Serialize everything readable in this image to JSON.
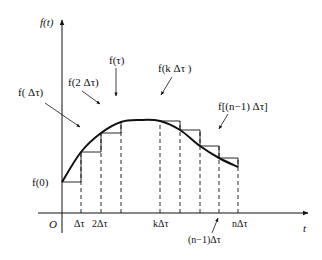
{
  "diagram": {
    "type": "staircase-approximation",
    "axes": {
      "y_label": "f(t)",
      "x_label": "t",
      "origin_label": "O"
    },
    "x_ticks": [
      {
        "label": "Δτ",
        "x": 81
      },
      {
        "label": "2Δτ",
        "x": 101
      },
      {
        "label": "kΔτ",
        "x": 160
      },
      {
        "label": "nΔτ",
        "x": 238
      }
    ],
    "x_tick_callout": {
      "label": "(n−1)Δτ",
      "x": 219
    },
    "annotations": [
      {
        "id": "f0",
        "label": "f(0)"
      },
      {
        "id": "f-dtau",
        "label": "f( Δτ)"
      },
      {
        "id": "f-2dtau",
        "label": "f(2 Δτ)"
      },
      {
        "id": "f-tau",
        "label": "f(τ)"
      },
      {
        "id": "f-kdtau",
        "label": "f(k Δτ )"
      },
      {
        "id": "f-n1dtau",
        "label": "f[(n−1) Δτ]"
      }
    ],
    "curve_points": [
      [
        62,
        182
      ],
      [
        81,
        152
      ],
      [
        101,
        133
      ],
      [
        121,
        122
      ],
      [
        140,
        120
      ],
      [
        160,
        121
      ],
      [
        180,
        130
      ],
      [
        200,
        146
      ],
      [
        219,
        158
      ],
      [
        238,
        167
      ]
    ],
    "steps": [
      {
        "x0": 62,
        "x1": 81,
        "y": 182
      },
      {
        "x0": 81,
        "x1": 101,
        "y": 152
      },
      {
        "x0": 101,
        "x1": 121,
        "y": 133
      },
      {
        "x0": 160,
        "x1": 180,
        "y": 121
      },
      {
        "x0": 180,
        "x1": 200,
        "y": 130
      },
      {
        "x0": 200,
        "x1": 219,
        "y": 146
      },
      {
        "x0": 219,
        "x1": 238,
        "y": 158
      }
    ],
    "dashed_x": [
      81,
      101,
      121,
      160,
      180,
      200,
      219,
      238
    ],
    "colors": {
      "ink": "#111111",
      "background": "#ffffff"
    }
  }
}
